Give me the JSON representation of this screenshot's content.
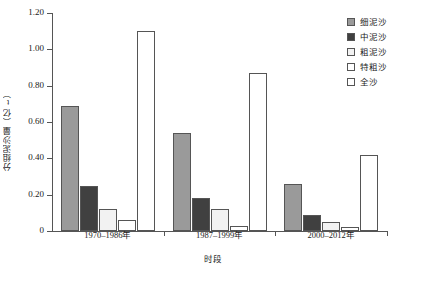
{
  "chart_data": {
    "type": "bar",
    "title": "",
    "xlabel": "时段",
    "ylabel": "分组泥沙量（亿t）",
    "categories": [
      "1970–1986年",
      "1987–1999年",
      "2000–2012年"
    ],
    "series": [
      {
        "name": "细泥沙",
        "values": [
          0.69,
          0.54,
          0.26
        ],
        "color": "#9a9a9a"
      },
      {
        "name": "中泥沙",
        "values": [
          0.25,
          0.18,
          0.09
        ],
        "color": "#404040"
      },
      {
        "name": "粗泥沙",
        "values": [
          0.12,
          0.12,
          0.05
        ],
        "color": "#f2f2f2"
      },
      {
        "name": "特粗沙",
        "values": [
          0.06,
          0.03,
          0.02
        ],
        "color": "#ffffff"
      },
      {
        "name": "全沙",
        "values": [
          1.1,
          0.87,
          0.42
        ],
        "color": "#ffffff"
      }
    ],
    "ylim": [
      0,
      1.2
    ],
    "yticks": [
      0,
      0.2,
      0.4,
      0.6,
      0.8,
      1.0,
      1.2
    ],
    "ytick_labels": [
      "0",
      "0.20",
      "0.40",
      "0.60",
      "0.80",
      "1.00",
      "1.20"
    ],
    "grid": false,
    "legend_position": "top-right",
    "bar_edge_color": "#555555"
  }
}
